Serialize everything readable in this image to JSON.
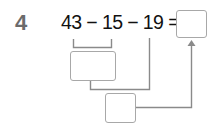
{
  "problem": {
    "number": "4",
    "equation": "43 − 15 − 19 =",
    "operands": [
      "43",
      "15",
      "19"
    ],
    "operators": [
      "−",
      "−",
      "="
    ]
  },
  "answer_boxes": {
    "intermediate_1": "",
    "intermediate_2": "",
    "final": ""
  },
  "colors": {
    "number": "#6b6b6b",
    "text": "#111111",
    "lines": "#8a8a8a",
    "box_border": "#a8a8a8"
  }
}
